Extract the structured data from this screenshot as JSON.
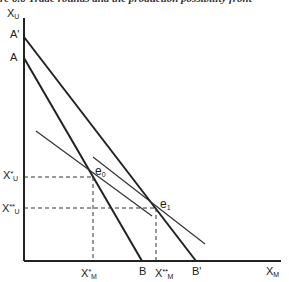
{
  "caption": "re 6.6   Trade rounds and the production possibility front",
  "diagram": {
    "axes": {
      "y_label": "X",
      "y_sub": "U",
      "x_label": "X",
      "x_sub": "M"
    },
    "points": {
      "A_prime": "A'",
      "A": "A",
      "B": "B",
      "B_prime": "B'",
      "e0": "e",
      "e0_sub": "0",
      "e1": "e",
      "e1_sub": "1"
    },
    "ticks": {
      "xu_star": "X",
      "xu_star_sub": "U",
      "xu_star_sup": "*",
      "xu_2star": "X",
      "xu_2star_sub": "U",
      "xu_2star_sup": "**",
      "xm_star": "X",
      "xm_star_sub": "M",
      "xm_star_sup": "*",
      "xm_2star": "X",
      "xm_2star_sub": "M",
      "xm_2star_sup": "**"
    },
    "colors": {
      "line": "#222222",
      "dashed": "#333333"
    }
  }
}
